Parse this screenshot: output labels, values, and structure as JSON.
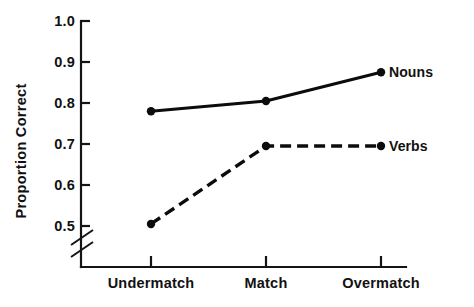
{
  "chart_data": {
    "type": "line",
    "title": "",
    "xlabel": "",
    "ylabel": "Proportion Correct",
    "categories": [
      "Undermatch",
      "Match",
      "Overmatch"
    ],
    "series": [
      {
        "name": "Nouns",
        "style": "solid",
        "values": [
          0.78,
          0.805,
          0.875
        ]
      },
      {
        "name": "Verbs",
        "style": "dashed",
        "values": [
          0.505,
          0.695,
          0.695
        ]
      }
    ],
    "ylim": [
      0.5,
      1.0
    ],
    "yticks": [
      0.5,
      0.6,
      0.7,
      0.8,
      0.9,
      1.0
    ],
    "ytick_labels": [
      "0.5",
      "0.6",
      "0.7",
      "0.8",
      "0.9",
      "1.0"
    ],
    "axis_break": true,
    "axis_break_note": "break below 0.5",
    "grid": false,
    "legend_position": "right-inline",
    "line_color": "#0c0c0c",
    "axis_color": "#141414",
    "background": "#ffffff"
  },
  "annotations": {
    "nouns_label": "Nouns",
    "verbs_label": "Verbs"
  }
}
